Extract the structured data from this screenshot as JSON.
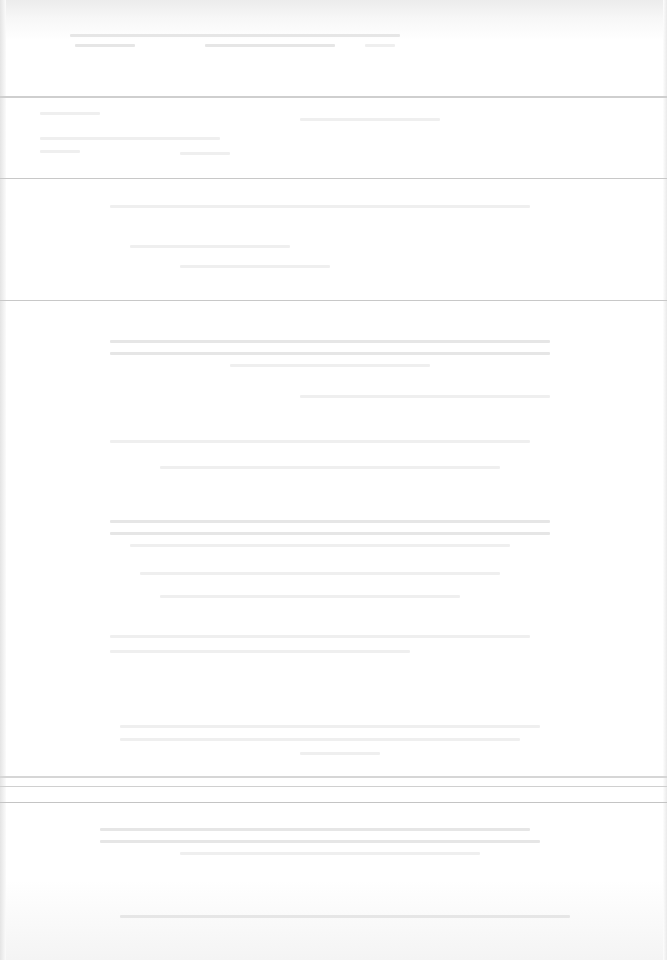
{
  "document": {
    "type": "scanned page",
    "legibility": "text too faint to read",
    "header": {
      "lines": 2
    },
    "sections": [
      {
        "name": "header-band",
        "top": 28,
        "bottom": 95
      },
      {
        "name": "table-band",
        "top": 100,
        "bottom": 180
      },
      {
        "name": "body-block-1",
        "top": 185,
        "bottom": 300
      },
      {
        "name": "body-block-2",
        "top": 300,
        "bottom": 760
      },
      {
        "name": "footer-band",
        "top": 775,
        "bottom": 960
      }
    ]
  },
  "colors": {
    "paper": "#ffffff",
    "rule": "#c8c8c8",
    "faint_text": "#e8e8e8"
  }
}
